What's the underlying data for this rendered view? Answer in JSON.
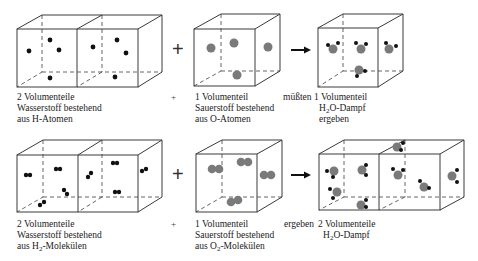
{
  "colors": {
    "hydrogen": "#111111",
    "oxygen": "#7a7a7a",
    "edge": "#3a3a3a"
  },
  "row1": {
    "left_label": [
      "2 Volumenteile",
      "Wasserstoff bestehend",
      "aus H-Atomen"
    ],
    "plus_small": "+",
    "middle_label": [
      "1 Volumenteil",
      "Sauerstoff bestehend",
      "aus O-Atomen"
    ],
    "verb": "müßten",
    "right_label_line1": "1 Volumenteil",
    "right_label_line2_pre": "H",
    "right_label_line2_sub": "2",
    "right_label_line2_post": "O-Dampf",
    "right_label_line3": "ergeben"
  },
  "row2": {
    "left_label_line1": "2 Volumenteile",
    "left_label_line2": "Wasserstoff bestehend",
    "left_label_line3_pre": "aus H",
    "left_label_line3_sub": "2",
    "left_label_line3_post": "-Molekülen",
    "plus_small": "+",
    "middle_label_line1": "1 Volumenteil",
    "middle_label_line2": "Sauerstoff bestehend",
    "middle_label_line3_pre": "aus O",
    "middle_label_line3_sub": "2",
    "middle_label_line3_post": "-Molekülen",
    "verb": "ergeben",
    "right_label_line1": "2 Volumenteile",
    "right_label_line2_pre": "H",
    "right_label_line2_sub": "2",
    "right_label_line2_post": "O-Dampf"
  },
  "operators": {
    "plus": "+",
    "arrow": "→"
  }
}
